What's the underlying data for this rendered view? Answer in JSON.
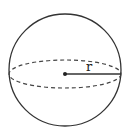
{
  "diagram": {
    "shape": "sphere",
    "radius_label": "r",
    "colors": {
      "stroke": "#333333",
      "background": "#ffffff"
    },
    "geometry": {
      "circle": {
        "cx": 65,
        "cy": 70,
        "r": 56
      },
      "equator": {
        "cx": 65,
        "cy": 74,
        "rx": 56,
        "ry": 14
      },
      "center_point": {
        "x": 65,
        "y": 74
      },
      "radius_end": {
        "x": 121,
        "y": 74
      },
      "label_pos": {
        "x": 86,
        "y": 71
      }
    }
  }
}
